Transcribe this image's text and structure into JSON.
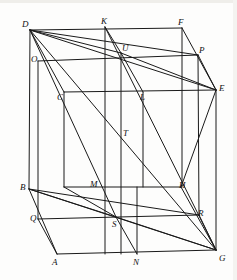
{
  "figure": {
    "kind": "3d-wireframe-geometry",
    "stroke_color": "#1a1a1a",
    "background_color": "#fdfdfc",
    "stroke_width": 1.0
  },
  "vertices": [
    {
      "name": "D",
      "label": "D",
      "x": 30,
      "y": 30,
      "lx": 22,
      "ly": 20
    },
    {
      "name": "K",
      "label": "K",
      "x": 105,
      "y": 27,
      "lx": 101,
      "ly": 17
    },
    {
      "name": "F",
      "label": "F",
      "x": 182,
      "y": 28,
      "lx": 178,
      "ly": 18
    },
    {
      "name": "U",
      "label": "U",
      "x": 121,
      "y": 53,
      "lx": 122,
      "ly": 44
    },
    {
      "name": "P",
      "label": "P",
      "x": 198,
      "y": 55,
      "lx": 199,
      "ly": 46
    },
    {
      "name": "O",
      "label": "O",
      "x": 38,
      "y": 61,
      "lx": 31,
      "ly": 55
    },
    {
      "name": "E",
      "label": "E",
      "x": 216,
      "y": 90,
      "lx": 219,
      "ly": 84
    },
    {
      "name": "C",
      "label": "C",
      "x": 64,
      "y": 92,
      "lx": 57,
      "ly": 93
    },
    {
      "name": "L",
      "label": "L",
      "x": 143,
      "y": 92,
      "lx": 140,
      "ly": 93
    },
    {
      "name": "T",
      "label": "T",
      "x": 121,
      "y": 134,
      "lx": 123,
      "ly": 129
    },
    {
      "name": "B",
      "label": "B",
      "x": 29,
      "y": 189,
      "lx": 20,
      "ly": 183
    },
    {
      "name": "M",
      "label": "M",
      "x": 64,
      "y": 187,
      "lx": 90,
      "ly": 180
    },
    {
      "name": "H",
      "label": "H",
      "x": 181,
      "y": 187,
      "lx": 179,
      "ly": 181
    },
    {
      "name": "Q",
      "label": "Q",
      "x": 38,
      "y": 219,
      "lx": 30,
      "ly": 214
    },
    {
      "name": "S",
      "label": "S",
      "x": 116,
      "y": 217,
      "lx": 112,
      "ly": 220
    },
    {
      "name": "R",
      "label": "R",
      "x": 199,
      "y": 215,
      "lx": 198,
      "ly": 209
    },
    {
      "name": "A",
      "label": "A",
      "x": 57,
      "y": 254,
      "lx": 52,
      "ly": 258
    },
    {
      "name": "N",
      "label": "N",
      "x": 137,
      "y": 254,
      "lx": 133,
      "ly": 258
    },
    {
      "name": "G",
      "label": "G",
      "x": 216,
      "y": 250,
      "lx": 219,
      "ly": 254
    }
  ],
  "edges": [
    {
      "name": "edge-D-F",
      "from": [
        30,
        30
      ],
      "to": [
        182,
        28
      ]
    },
    {
      "name": "edge-D-B",
      "from": [
        30,
        30
      ],
      "to": [
        29,
        189
      ]
    },
    {
      "name": "edge-F-E",
      "from": [
        182,
        28
      ],
      "to": [
        216,
        90
      ]
    },
    {
      "name": "edge-E-G",
      "from": [
        216,
        90
      ],
      "to": [
        216,
        250
      ]
    },
    {
      "name": "edge-B-A",
      "from": [
        29,
        189
      ],
      "to": [
        57,
        254
      ]
    },
    {
      "name": "edge-A-G",
      "from": [
        57,
        254
      ],
      "to": [
        216,
        250
      ]
    },
    {
      "name": "edge-O-P",
      "from": [
        38,
        61
      ],
      "to": [
        198,
        55
      ]
    },
    {
      "name": "edge-O-Q",
      "from": [
        38,
        61
      ],
      "to": [
        38,
        219
      ]
    },
    {
      "name": "edge-P-E2",
      "from": [
        198,
        55
      ],
      "to": [
        216,
        90
      ]
    },
    {
      "name": "edge-Q-R",
      "from": [
        38,
        219
      ],
      "to": [
        199,
        215
      ]
    },
    {
      "name": "edge-R-G",
      "from": [
        199,
        215
      ],
      "to": [
        216,
        250
      ]
    },
    {
      "name": "edge-P-R",
      "from": [
        198,
        55
      ],
      "to": [
        199,
        215
      ]
    },
    {
      "name": "edge-C-L",
      "from": [
        64,
        92
      ],
      "to": [
        216,
        90
      ]
    },
    {
      "name": "edge-C-M",
      "from": [
        64,
        92
      ],
      "to": [
        64,
        187
      ]
    },
    {
      "name": "edge-M-H",
      "from": [
        64,
        187
      ],
      "to": [
        181,
        187
      ]
    },
    {
      "name": "edge-L-HV",
      "from": [
        143,
        92
      ],
      "to": [
        143,
        187
      ]
    },
    {
      "name": "edge-H-E",
      "from": [
        181,
        187
      ],
      "to": [
        216,
        90
      ]
    },
    {
      "name": "edge-H-G",
      "from": [
        181,
        187
      ],
      "to": [
        216,
        250
      ]
    },
    {
      "name": "edge-K-V",
      "from": [
        105,
        27
      ],
      "to": [
        105,
        254
      ]
    },
    {
      "name": "edge-U-V",
      "from": [
        121,
        53
      ],
      "to": [
        121,
        254
      ]
    },
    {
      "name": "edge-F-V",
      "from": [
        182,
        28
      ],
      "to": [
        182,
        187
      ]
    },
    {
      "name": "edge-N-V",
      "from": [
        137,
        254
      ],
      "to": [
        137,
        187
      ]
    },
    {
      "name": "diag-D-G",
      "from": [
        30,
        30
      ],
      "to": [
        216,
        250
      ]
    },
    {
      "name": "diag-D-E",
      "from": [
        30,
        30
      ],
      "to": [
        216,
        90
      ]
    },
    {
      "name": "diag-D-P",
      "from": [
        30,
        30
      ],
      "to": [
        198,
        55
      ]
    },
    {
      "name": "diag-D-U",
      "from": [
        30,
        30
      ],
      "to": [
        121,
        53
      ]
    },
    {
      "name": "diag-D-C",
      "from": [
        30,
        30
      ],
      "to": [
        64,
        92
      ]
    },
    {
      "name": "diag-D-S",
      "from": [
        30,
        30
      ],
      "to": [
        116,
        217
      ]
    },
    {
      "name": "diag-K-U",
      "from": [
        105,
        27
      ],
      "to": [
        121,
        53
      ]
    },
    {
      "name": "diag-U-L",
      "from": [
        121,
        53
      ],
      "to": [
        143,
        92
      ]
    },
    {
      "name": "diag-K-G",
      "from": [
        105,
        27
      ],
      "to": [
        216,
        250
      ]
    },
    {
      "name": "diag-B-G",
      "from": [
        29,
        189
      ],
      "to": [
        216,
        250
      ]
    },
    {
      "name": "diag-B-S",
      "from": [
        29,
        189
      ],
      "to": [
        116,
        217
      ]
    },
    {
      "name": "diag-B-R",
      "from": [
        29,
        189
      ],
      "to": [
        199,
        215
      ]
    },
    {
      "name": "diag-S-G",
      "from": [
        116,
        217
      ],
      "to": [
        216,
        250
      ]
    },
    {
      "name": "diag-S-N",
      "from": [
        116,
        217
      ],
      "to": [
        137,
        254
      ]
    },
    {
      "name": "diag-Q-A",
      "from": [
        38,
        219
      ],
      "to": [
        57,
        254
      ]
    },
    {
      "name": "diag-M-S",
      "from": [
        64,
        187
      ],
      "to": [
        116,
        217
      ]
    },
    {
      "name": "diag-U-E",
      "from": [
        121,
        53
      ],
      "to": [
        216,
        90
      ]
    }
  ]
}
